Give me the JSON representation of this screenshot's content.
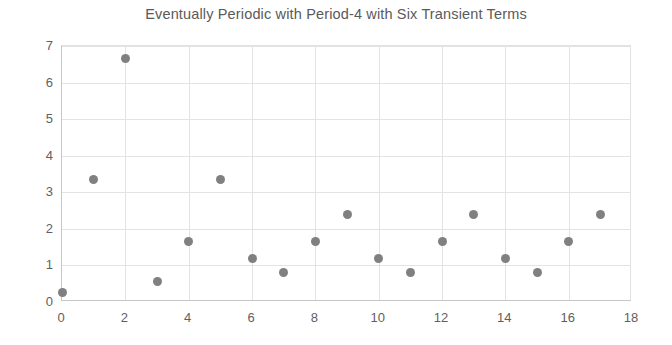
{
  "chart_data": {
    "type": "scatter",
    "title": "Eventually Periodic with Period-4 with Six Transient Terms",
    "xlabel": "",
    "ylabel": "",
    "xlim": [
      0,
      18
    ],
    "ylim": [
      0,
      7
    ],
    "x_ticks": [
      0,
      2,
      4,
      6,
      8,
      10,
      12,
      14,
      16,
      18
    ],
    "y_ticks": [
      0,
      1,
      2,
      3,
      4,
      5,
      6,
      7
    ],
    "x_gridlines": [
      2,
      4,
      6,
      8,
      10,
      12,
      14,
      16
    ],
    "y_gridlines": [
      1,
      2,
      3,
      4,
      5,
      6,
      7
    ],
    "grid": true,
    "legend": false,
    "marker": "circle",
    "marker_color": "#808080",
    "x": [
      0,
      1,
      2,
      3,
      4,
      5,
      6,
      7,
      8,
      9,
      10,
      11,
      12,
      13,
      14,
      15,
      16,
      17
    ],
    "values": [
      0.25,
      3.35,
      6.65,
      0.55,
      1.65,
      3.35,
      1.2,
      0.8,
      1.65,
      2.4,
      1.2,
      0.8,
      1.65,
      2.4,
      1.2,
      0.8,
      1.65,
      2.4
    ]
  },
  "axis": {
    "y_tick_labels": [
      "0",
      "1",
      "2",
      "3",
      "4",
      "5",
      "6",
      "7"
    ],
    "x_tick_labels": [
      "0",
      "2",
      "4",
      "6",
      "8",
      "10",
      "12",
      "14",
      "16",
      "18"
    ]
  }
}
